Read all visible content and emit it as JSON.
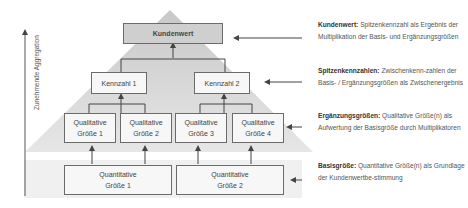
{
  "axis": {
    "label": "Zunehmende Aggregation"
  },
  "pyramid": {
    "top": {
      "label": "Kundenwert"
    },
    "kennzahlen": [
      {
        "label": "Kennzahl 1"
      },
      {
        "label": "Kennzahl 2"
      }
    ],
    "qualitative": [
      {
        "line1": "Qualitative",
        "line2": "Größe 1"
      },
      {
        "line1": "Qualitative",
        "line2": "Größe 2"
      },
      {
        "line1": "Qualitative",
        "line2": "Größe 3"
      },
      {
        "line1": "Qualitative",
        "line2": "Größe 4"
      }
    ],
    "quantitative": [
      {
        "line1": "Quantitative",
        "line2": "Größe 1"
      },
      {
        "line1": "Quantitative",
        "line2": "Größe 2"
      }
    ]
  },
  "descriptions": [
    {
      "term": "Kundenwert:",
      "text": " Spitzenkennzahl als Ergebnis der Multiplikation der Basis- und Ergänzungsgrößen"
    },
    {
      "term": "Spitzenkennzahlen:",
      "text": " Zwischenkenn-zahlen der Basis- / Ergänzungsgrößen als Zwischenergebnis"
    },
    {
      "term": "Ergänzungsgrößen:",
      "text": " Qualitative Größe(n) als Aufwertung der Basisgröße durch Multiplikatoren"
    },
    {
      "term": "Basisgröße:",
      "text": " Quantitative Größe(n) als Grundlage der Kundenwertbe-stimmung"
    }
  ],
  "colors": {
    "pyramid_top": "#cfcfcf",
    "pyramid_bottom": "#e4e4e4",
    "base_band": "#efefef",
    "box_border": "#6b6b6b"
  }
}
